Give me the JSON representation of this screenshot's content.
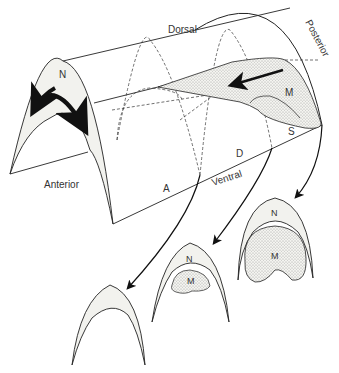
{
  "diagram": {
    "type": "3D schematic of embryonic neural/mesoderm tube with cross-sections",
    "axis_labels": {
      "dorsal": "Dorsal",
      "ventral": "Ventral",
      "anterior": "Anterior",
      "posterior": "Posterior"
    },
    "region_labels": {
      "a": "A",
      "d": "D",
      "s": "S",
      "m": "M",
      "n": "N"
    },
    "cross_sections": [
      {
        "position": "anterior",
        "labels": []
      },
      {
        "position": "middle",
        "labels": [
          "N",
          "M"
        ]
      },
      {
        "position": "posterior",
        "labels": [
          "N",
          "M"
        ]
      }
    ],
    "colors": {
      "line": "#222222",
      "fill_light": "#f2f2ee",
      "stipple": "#555555",
      "background": "#ffffff"
    }
  }
}
